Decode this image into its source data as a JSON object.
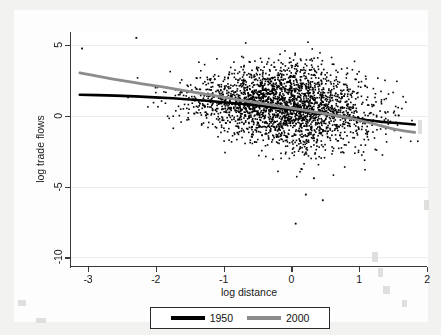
{
  "chart_data": {
    "type": "scatter",
    "title": "",
    "xlabel": "log distance",
    "ylabel": "log trade flows",
    "xlim": [
      -3.25,
      2.0
    ],
    "ylim": [
      -10.6,
      5.9
    ],
    "xticks": [
      -3,
      -2,
      -1,
      0,
      1,
      2
    ],
    "xticklabels": [
      "-3",
      "-2",
      "-1",
      "0",
      "1",
      "2"
    ],
    "yticks": [
      5,
      0,
      -5,
      -10
    ],
    "yticklabels": [
      "5",
      "0",
      "-5",
      "-10"
    ],
    "grid": "horizontal-faint",
    "legend_position": "bottom-center",
    "scatter": {
      "name": "observations",
      "marker": "square",
      "marker_size_px": 1.6,
      "color": "#000000",
      "n_points": 2600,
      "description": "Dense cloud of bilateral trade observations, densest near x=0.2, y=0.2; spread widens toward the center-right; declining trend.",
      "cloud_center_x": 0.15,
      "cloud_center_y": 0.1,
      "x_range_observed": [
        -3.1,
        1.85
      ],
      "y_range_observed": [
        -7.6,
        5.6
      ],
      "outliers": [
        {
          "x": 0.05,
          "y": -7.55
        },
        {
          "x": 0.45,
          "y": -5.9
        },
        {
          "x": 0.2,
          "y": -5.5
        },
        {
          "x": 0.32,
          "y": -4.35
        },
        {
          "x": -3.1,
          "y": 4.8
        },
        {
          "x": -2.3,
          "y": 5.55
        }
      ]
    },
    "series": [
      {
        "name": "1950",
        "type": "line",
        "color": "#000000",
        "width_px": 2.6,
        "points": [
          {
            "x": -3.12,
            "y": 1.48
          },
          {
            "x": -2.6,
            "y": 1.42
          },
          {
            "x": -2.0,
            "y": 1.3
          },
          {
            "x": -1.5,
            "y": 1.15
          },
          {
            "x": -1.0,
            "y": 0.95
          },
          {
            "x": -0.5,
            "y": 0.72
          },
          {
            "x": 0.0,
            "y": 0.45
          },
          {
            "x": 0.5,
            "y": 0.12
          },
          {
            "x": 0.9,
            "y": -0.18
          },
          {
            "x": 1.3,
            "y": -0.42
          },
          {
            "x": 1.82,
            "y": -0.62
          }
        ]
      },
      {
        "name": "2000",
        "type": "line",
        "color": "#8c8c8c",
        "width_px": 2.8,
        "points": [
          {
            "x": -3.12,
            "y": 3.02
          },
          {
            "x": -2.8,
            "y": 2.72
          },
          {
            "x": -2.5,
            "y": 2.48
          },
          {
            "x": -2.2,
            "y": 2.24
          },
          {
            "x": -1.9,
            "y": 2.02
          },
          {
            "x": -1.6,
            "y": 1.78
          },
          {
            "x": -1.3,
            "y": 1.55
          },
          {
            "x": -1.0,
            "y": 1.3
          },
          {
            "x": -0.6,
            "y": 0.98
          },
          {
            "x": -0.2,
            "y": 0.68
          },
          {
            "x": 0.2,
            "y": 0.38
          },
          {
            "x": 0.6,
            "y": 0.06
          },
          {
            "x": 0.9,
            "y": -0.2
          },
          {
            "x": 1.2,
            "y": -0.55
          },
          {
            "x": 1.5,
            "y": -0.95
          },
          {
            "x": 1.82,
            "y": -1.18
          }
        ]
      }
    ],
    "legend": [
      {
        "label": "1950",
        "color": "#000000"
      },
      {
        "label": "2000",
        "color": "#8c8c8c"
      }
    ]
  },
  "axes": {
    "x_title": "log distance",
    "y_title": "log trade flows",
    "x_tick_labels": [
      "-3",
      "-2",
      "-1",
      "0",
      "1",
      "2"
    ],
    "y_tick_labels": [
      "5",
      "0",
      "-5",
      "-10"
    ]
  },
  "legend": {
    "items": [
      {
        "label": "1950",
        "color": "#000000"
      },
      {
        "label": "2000",
        "color": "#8c8c8c"
      }
    ]
  },
  "colors": {
    "page_background": "#f2f2f1",
    "graph_background": "#fdfdfd",
    "plot_background": "#ffffff",
    "axis": "#3a3a3a",
    "series_1950": "#000000",
    "series_2000": "#8c8c8c",
    "gridline": "#ececec"
  }
}
